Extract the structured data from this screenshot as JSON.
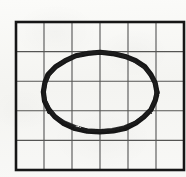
{
  "figure": {
    "caption": "Hand-drawn ellipse on a ruled grid",
    "type": "geometry-sketch",
    "background_color": "#f7f7f5"
  },
  "grid": {
    "name": "grid",
    "columns": 6,
    "rows": 5,
    "left": 16,
    "top": 22,
    "right": 184,
    "bottom": 170,
    "cell_width": 28,
    "cell_height": 29.6,
    "line_color": "#555553",
    "line_width": 1,
    "border_color": "#151515",
    "border_width": 2.6,
    "vertical_line_x": [
      16,
      44,
      72,
      100,
      128,
      156,
      184
    ],
    "horizontal_line_y": [
      22,
      51.6,
      81.2,
      110.8,
      140.4,
      170
    ]
  },
  "shape": {
    "name": "ellipse",
    "label": "ellipse",
    "stroke_color": "#141414",
    "stroke_width": 5.2,
    "center_x": 100,
    "center_y": 92,
    "radius_x": 57,
    "radius_y": 40,
    "bounds": {
      "left": 43,
      "top": 52,
      "right": 157,
      "bottom": 132,
      "width": 114,
      "height": 80
    },
    "spans_columns": "1 through 5",
    "spans_rows": "1 through 4",
    "hand_drawn": "true"
  }
}
